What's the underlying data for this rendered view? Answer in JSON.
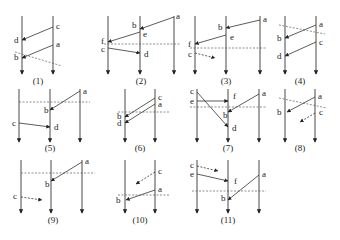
{
  "figure": {
    "diagrams": [
      {
        "caption": "(1)",
        "lines": [
          {
            "x": 22,
            "y1": 16,
            "y2": 74
          },
          {
            "x": 53,
            "y1": 16,
            "y2": 74
          }
        ],
        "messages": [
          {
            "from": [
              53,
              27
            ],
            "to": [
              22,
              40
            ],
            "style": "solid"
          },
          {
            "from": [
              53,
              45
            ],
            "to": [
              22,
              58
            ],
            "style": "solid"
          }
        ],
        "cuts": [
          [
            15,
            52,
            62,
            66
          ]
        ],
        "labels": [
          {
            "t": "c",
            "x": 56,
            "y": 29
          },
          {
            "t": "a",
            "x": 56,
            "y": 47
          },
          {
            "t": "d",
            "x": 14,
            "y": 43
          },
          {
            "t": "b",
            "x": 14,
            "y": 60
          }
        ],
        "cap_x": 38,
        "cap_y": 84
      },
      {
        "caption": "(2)",
        "lines": [
          {
            "x": 108,
            "y1": 16,
            "y2": 74
          },
          {
            "x": 140,
            "y1": 16,
            "y2": 74
          },
          {
            "x": 174,
            "y1": 16,
            "y2": 74
          }
        ],
        "messages": [
          {
            "from": [
              174,
              17
            ],
            "to": [
              140,
              29
            ],
            "style": "solid"
          },
          {
            "from": [
              140,
              32
            ],
            "to": [
              108,
              42
            ],
            "style": "solid"
          },
          {
            "from": [
              108,
              48
            ],
            "to": [
              140,
              53
            ],
            "style": "solid"
          }
        ],
        "cuts": [
          [
            104,
            44,
            180,
            44
          ]
        ],
        "labels": [
          {
            "t": "a",
            "x": 176,
            "y": 19
          },
          {
            "t": "b",
            "x": 132,
            "y": 28
          },
          {
            "t": "e",
            "x": 143,
            "y": 37
          },
          {
            "t": "f",
            "x": 101,
            "y": 44
          },
          {
            "t": "c",
            "x": 101,
            "y": 52
          },
          {
            "t": "d",
            "x": 144,
            "y": 57
          }
        ],
        "cap_x": 141,
        "cap_y": 84
      },
      {
        "caption": "(3)",
        "lines": [
          {
            "x": 195,
            "y1": 16,
            "y2": 74
          },
          {
            "x": 226,
            "y1": 16,
            "y2": 74
          },
          {
            "x": 260,
            "y1": 16,
            "y2": 74
          }
        ],
        "messages": [
          {
            "from": [
              260,
              20
            ],
            "to": [
              226,
              28
            ],
            "style": "solid"
          },
          {
            "from": [
              226,
              35
            ],
            "to": [
              195,
              44
            ],
            "style": "solid"
          },
          {
            "from": [
              195,
              53
            ],
            "to": [
              215,
              58
            ],
            "style": "dashed"
          }
        ],
        "cuts": [
          [
            190,
            48,
            266,
            48
          ]
        ],
        "labels": [
          {
            "t": "a",
            "x": 263,
            "y": 22
          },
          {
            "t": "b",
            "x": 218,
            "y": 30
          },
          {
            "t": "e",
            "x": 230,
            "y": 40
          },
          {
            "t": "f",
            "x": 188,
            "y": 47
          },
          {
            "t": "c",
            "x": 188,
            "y": 57
          }
        ],
        "cap_x": 226,
        "cap_y": 84
      },
      {
        "caption": "(4)",
        "lines": [
          {
            "x": 285,
            "y1": 16,
            "y2": 74
          },
          {
            "x": 316,
            "y1": 16,
            "y2": 74
          }
        ],
        "messages": [
          {
            "from": [
              316,
              25
            ],
            "to": [
              285,
              38
            ],
            "style": "solid"
          },
          {
            "from": [
              316,
              42
            ],
            "to": [
              285,
              56
            ],
            "style": "solid"
          }
        ],
        "cuts": [
          [
            279,
            25,
            325,
            34
          ]
        ],
        "labels": [
          {
            "t": "a",
            "x": 319,
            "y": 27
          },
          {
            "t": "c",
            "x": 319,
            "y": 45
          },
          {
            "t": "b",
            "x": 277,
            "y": 41
          },
          {
            "t": "d",
            "x": 277,
            "y": 59
          }
        ],
        "cap_x": 300,
        "cap_y": 84
      },
      {
        "caption": "(5)",
        "lines": [
          {
            "x": 19,
            "y1": 89,
            "y2": 142
          },
          {
            "x": 50,
            "y1": 89,
            "y2": 142
          },
          {
            "x": 80,
            "y1": 89,
            "y2": 142
          }
        ],
        "messages": [
          {
            "from": [
              80,
              91
            ],
            "to": [
              50,
              110
            ],
            "style": "solid"
          },
          {
            "from": [
              19,
              123
            ],
            "to": [
              50,
              127
            ],
            "style": "solid"
          }
        ],
        "cuts": [
          [
            19,
            102,
            90,
            102
          ]
        ],
        "labels": [
          {
            "t": "a",
            "x": 83,
            "y": 94
          },
          {
            "t": "b",
            "x": 44,
            "y": 113
          },
          {
            "t": "c",
            "x": 12,
            "y": 126
          },
          {
            "t": "d",
            "x": 54,
            "y": 130
          }
        ],
        "cap_x": 50,
        "cap_y": 151
      },
      {
        "caption": "(6)",
        "lines": [
          {
            "x": 125,
            "y1": 89,
            "y2": 142
          },
          {
            "x": 155,
            "y1": 89,
            "y2": 142
          }
        ],
        "messages": [
          {
            "from": [
              155,
              98
            ],
            "to": [
              125,
              117
            ],
            "style": "solid"
          },
          {
            "from": [
              155,
              104
            ],
            "to": [
              125,
              123
            ],
            "style": "solid"
          }
        ],
        "cuts": [
          [
            118,
            112,
            170,
            112
          ]
        ],
        "labels": [
          {
            "t": "c",
            "x": 158,
            "y": 100
          },
          {
            "t": "a",
            "x": 158,
            "y": 107
          },
          {
            "t": "b",
            "x": 117,
            "y": 119
          },
          {
            "t": "d",
            "x": 117,
            "y": 126
          }
        ],
        "cap_x": 140,
        "cap_y": 151
      },
      {
        "caption": "(7)",
        "lines": [
          {
            "x": 197,
            "y1": 89,
            "y2": 142
          },
          {
            "x": 228,
            "y1": 89,
            "y2": 142
          },
          {
            "x": 259,
            "y1": 89,
            "y2": 142
          }
        ],
        "messages": [
          {
            "from": [
              197,
              92
            ],
            "to": [
              228,
              127
            ],
            "style": "solid"
          },
          {
            "from": [
              197,
              101
            ],
            "to": [
              228,
              101
            ],
            "style": "solid"
          },
          {
            "from": [
              259,
              94
            ],
            "to": [
              228,
              112
            ],
            "style": "solid"
          }
        ],
        "cuts": [
          [
            190,
            107,
            266,
            107
          ]
        ],
        "labels": [
          {
            "t": "c",
            "x": 190,
            "y": 94
          },
          {
            "t": "e",
            "x": 190,
            "y": 104
          },
          {
            "t": "f",
            "x": 233,
            "y": 99
          },
          {
            "t": "a",
            "x": 262,
            "y": 96
          },
          {
            "t": "b",
            "x": 223,
            "y": 118
          },
          {
            "t": "d",
            "x": 232,
            "y": 131
          }
        ],
        "cap_x": 228,
        "cap_y": 151
      },
      {
        "caption": "(8)",
        "lines": [
          {
            "x": 285,
            "y1": 89,
            "y2": 142
          },
          {
            "x": 315,
            "y1": 89,
            "y2": 142
          }
        ],
        "messages": [
          {
            "from": [
              315,
              97
            ],
            "to": [
              287,
              112
            ],
            "style": "solid"
          },
          {
            "from": [
              315,
              113
            ],
            "to": [
              300,
              122
            ],
            "style": "dashed"
          }
        ],
        "cuts": [
          [
            279,
            98,
            327,
            108
          ]
        ],
        "labels": [
          {
            "t": "a",
            "x": 318,
            "y": 99
          },
          {
            "t": "b",
            "x": 277,
            "y": 115
          },
          {
            "t": "c",
            "x": 319,
            "y": 115
          }
        ],
        "cap_x": 300,
        "cap_y": 151
      },
      {
        "caption": "(9)",
        "lines": [
          {
            "x": 21,
            "y1": 160,
            "y2": 213
          },
          {
            "x": 51,
            "y1": 160,
            "y2": 213
          },
          {
            "x": 82,
            "y1": 160,
            "y2": 213
          }
        ],
        "messages": [
          {
            "from": [
              82,
              162
            ],
            "to": [
              51,
              181
            ],
            "style": "solid"
          },
          {
            "from": [
              21,
              197
            ],
            "to": [
              42,
              200
            ],
            "style": "dashed"
          }
        ],
        "cuts": [
          [
            21,
            173,
            95,
            173
          ]
        ],
        "labels": [
          {
            "t": "a",
            "x": 85,
            "y": 164
          },
          {
            "t": "b",
            "x": 45,
            "y": 187
          },
          {
            "t": "c",
            "x": 13,
            "y": 199
          }
        ],
        "cap_x": 53,
        "cap_y": 223
      },
      {
        "caption": "(10)",
        "lines": [
          {
            "x": 125,
            "y1": 160,
            "y2": 213
          },
          {
            "x": 155,
            "y1": 160,
            "y2": 213
          }
        ],
        "messages": [
          {
            "from": [
              155,
              172
            ],
            "to": [
              136,
              184
            ],
            "style": "dashed"
          },
          {
            "from": [
              155,
              190
            ],
            "to": [
              126,
              200
            ],
            "style": "solid"
          }
        ],
        "cuts": [
          [
            118,
            195,
            170,
            195
          ]
        ],
        "labels": [
          {
            "t": "c",
            "x": 158,
            "y": 174
          },
          {
            "t": "a",
            "x": 158,
            "y": 192
          },
          {
            "t": "b",
            "x": 116,
            "y": 203
          }
        ],
        "cap_x": 140,
        "cap_y": 223
      },
      {
        "caption": "(11)",
        "lines": [
          {
            "x": 197,
            "y1": 160,
            "y2": 213
          },
          {
            "x": 228,
            "y1": 160,
            "y2": 213
          },
          {
            "x": 259,
            "y1": 160,
            "y2": 213
          }
        ],
        "messages": [
          {
            "from": [
              197,
              166
            ],
            "to": [
              218,
              171
            ],
            "style": "dashed"
          },
          {
            "from": [
              197,
              174
            ],
            "to": [
              228,
              181
            ],
            "style": "solid"
          },
          {
            "from": [
              259,
              175
            ],
            "to": [
              228,
              200
            ],
            "style": "solid"
          }
        ],
        "cuts": [
          [
            192,
            191,
            266,
            191
          ]
        ],
        "labels": [
          {
            "t": "c",
            "x": 190,
            "y": 168
          },
          {
            "t": "e",
            "x": 190,
            "y": 177
          },
          {
            "t": "f",
            "x": 234,
            "y": 184
          },
          {
            "t": "a",
            "x": 262,
            "y": 177
          },
          {
            "t": "b",
            "x": 221,
            "y": 201
          }
        ],
        "cap_x": 228,
        "cap_y": 223
      }
    ]
  }
}
